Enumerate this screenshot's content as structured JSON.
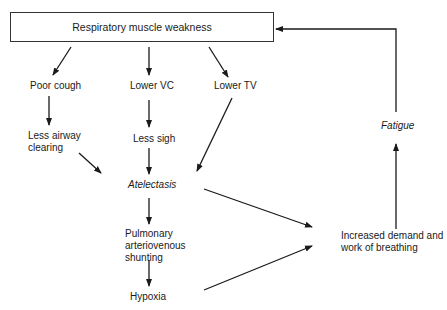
{
  "diagram": {
    "type": "flowchart",
    "root": {
      "label": "Respiratory muscle weakness"
    },
    "nodes": {
      "poor_cough": "Poor cough",
      "lower_vc": "Lower VC",
      "lower_tv": "Lower TV",
      "less_airway_1": "Less airway",
      "less_airway_2": "clearing",
      "less_sigh": "Less sigh",
      "atelectasis": "Atelectasis",
      "shunt_1": "Pulmonary",
      "shunt_2": "arteriovenous",
      "shunt_3": "shunting",
      "hypoxia": "Hypoxia",
      "demand_1": "Increased demand and",
      "demand_2": "work of breathing",
      "fatigue": "Fatigue"
    },
    "edges": [
      {
        "from": "Respiratory muscle weakness",
        "to": "Poor cough"
      },
      {
        "from": "Respiratory muscle weakness",
        "to": "Lower VC"
      },
      {
        "from": "Respiratory muscle weakness",
        "to": "Lower TV"
      },
      {
        "from": "Poor cough",
        "to": "Less airway clearing"
      },
      {
        "from": "Lower VC",
        "to": "Less sigh"
      },
      {
        "from": "Less airway clearing",
        "to": "Atelectasis"
      },
      {
        "from": "Less sigh",
        "to": "Atelectasis"
      },
      {
        "from": "Lower TV",
        "to": "Atelectasis"
      },
      {
        "from": "Atelectasis",
        "to": "Pulmonary arteriovenous shunting"
      },
      {
        "from": "Pulmonary arteriovenous shunting",
        "to": "Hypoxia"
      },
      {
        "from": "Atelectasis",
        "to": "Increased demand and work of breathing"
      },
      {
        "from": "Hypoxia",
        "to": "Increased demand and work of breathing"
      },
      {
        "from": "Increased demand and work of breathing",
        "to": "Fatigue"
      },
      {
        "from": "Fatigue",
        "to": "Respiratory muscle weakness"
      }
    ]
  }
}
